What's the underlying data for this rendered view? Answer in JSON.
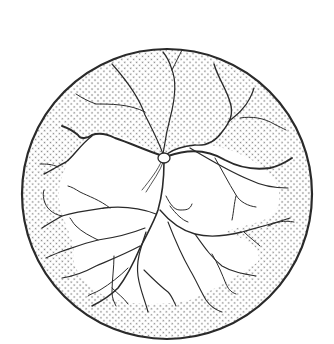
{
  "figure": {
    "background": "#ffffff",
    "stroke_color": "#2a2a2a",
    "stipple_color": "#8a8a8a",
    "circle": {
      "cx": 167,
      "cy": 194,
      "r": 145
    },
    "optic_disc": {
      "cx": 164,
      "cy": 158,
      "rx": 6,
      "ry": 5
    },
    "regions": [
      {
        "name": "stippled-periphery",
        "fill": "stipple"
      },
      {
        "name": "central-avascular-clear-zone",
        "fill": "#ffffff"
      }
    ]
  }
}
